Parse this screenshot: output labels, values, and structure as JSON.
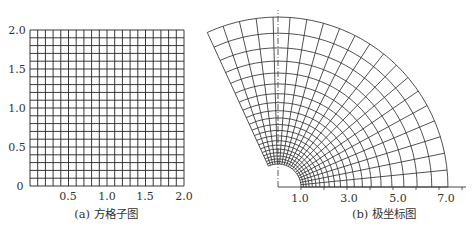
{
  "panels": [
    {
      "id": "a",
      "caption": "(a) 方格子图",
      "type": "square-grid",
      "x_range": [
        0,
        2.0
      ],
      "y_range": [
        0,
        2.0
      ],
      "divisions": 20,
      "x_ticks": [
        "0.5",
        "1.0",
        "1.5",
        "2.0"
      ],
      "y_ticks": [
        "0",
        "0.5",
        "1.0",
        "1.5",
        "2.0"
      ],
      "line_color": "#222222"
    },
    {
      "id": "b",
      "caption": "(b) 极坐标图",
      "type": "polar-grid",
      "mapping": "w = e^z",
      "r_range": [
        1.0,
        7.39
      ],
      "theta_range_rad": [
        0,
        2.0
      ],
      "radial_divisions": 20,
      "angular_divisions": 20,
      "x_ticks": [
        "1.0",
        "3.0",
        "5.0",
        "7.0"
      ],
      "line_color": "#333333"
    }
  ],
  "chart_data": [
    {
      "type": "diagram",
      "title": "(a) 方格子图",
      "xlabel": "",
      "ylabel": "",
      "xlim": [
        0,
        2.0
      ],
      "ylim": [
        0,
        2.0
      ],
      "grid": true,
      "grid_step": 0.1,
      "x_tick_labels": [
        "0.5",
        "1.0",
        "1.5",
        "2.0"
      ],
      "y_tick_labels": [
        "0",
        "0.5",
        "1.0",
        "1.5",
        "2.0"
      ]
    },
    {
      "type": "diagram",
      "title": "(b) 极坐标图",
      "description": "Conformal image of the square grid under exp map: rings r = e^(0.1k), k=0..20; rays theta = 0.1k rad, k=0..20",
      "r_min": 1.0,
      "r_max": 7.39,
      "theta_min_rad": 0,
      "theta_max_rad": 2.0,
      "x_tick_labels": [
        "1.0",
        "3.0",
        "5.0",
        "7.0"
      ],
      "x_ticks_minor": [
        1,
        2,
        3,
        4,
        5,
        6,
        7,
        8
      ]
    }
  ]
}
